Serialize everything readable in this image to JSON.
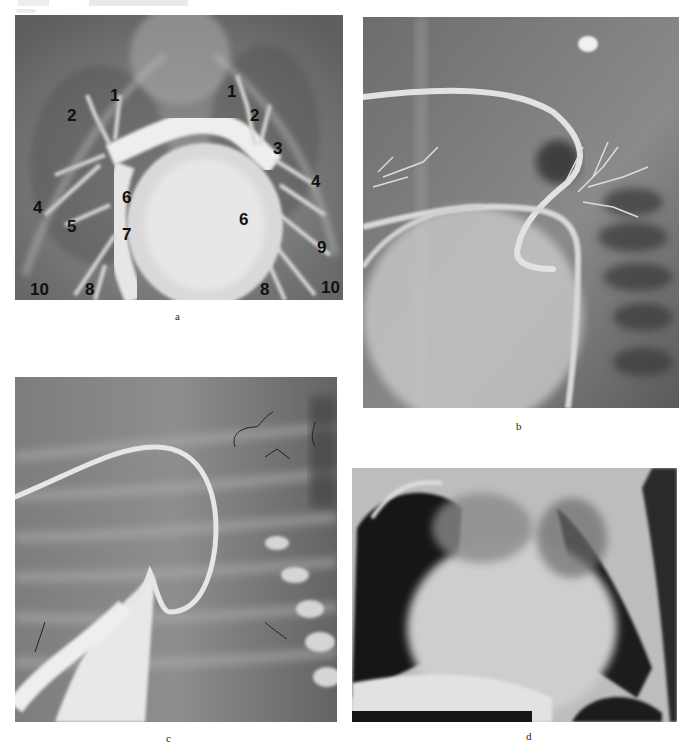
{
  "page": {
    "header_text": "",
    "figure": {
      "panels": [
        {
          "id": "a",
          "caption": "a",
          "description": "Pulmonary angiogram, frontal view, with numbered vessel labels",
          "labels": [
            {
              "text": "1",
              "x": 110,
              "y": 80
            },
            {
              "text": "2",
              "x": 70,
              "y": 99
            },
            {
              "text": "1",
              "x": 230,
              "y": 76
            },
            {
              "text": "2",
              "x": 254,
              "y": 99
            },
            {
              "text": "3",
              "x": 279,
              "y": 133
            },
            {
              "text": "4",
              "x": 316,
              "y": 184
            },
            {
              "text": "4",
              "x": 38,
              "y": 211
            },
            {
              "text": "6",
              "x": 127,
              "y": 201
            },
            {
              "text": "5",
              "x": 72,
              "y": 229
            },
            {
              "text": "6",
              "x": 246,
              "y": 222
            },
            {
              "text": "7",
              "x": 127,
              "y": 237
            },
            {
              "text": "9",
              "x": 324,
              "y": 250
            },
            {
              "text": "10",
              "x": 42,
              "y": 290
            },
            {
              "text": "8",
              "x": 91,
              "y": 290
            },
            {
              "text": "8",
              "x": 265,
              "y": 290
            },
            {
              "text": "10",
              "x": 330,
              "y": 288
            }
          ]
        },
        {
          "id": "b",
          "caption": "b",
          "description": "Selective angiogram with looped catheter and branching vessels"
        },
        {
          "id": "c",
          "caption": "c",
          "description": "Angiogram with curved catheter over ribcage"
        },
        {
          "id": "d",
          "caption": "d",
          "description": "Chest radiograph with enlarged cardiac silhouette"
        }
      ]
    }
  }
}
